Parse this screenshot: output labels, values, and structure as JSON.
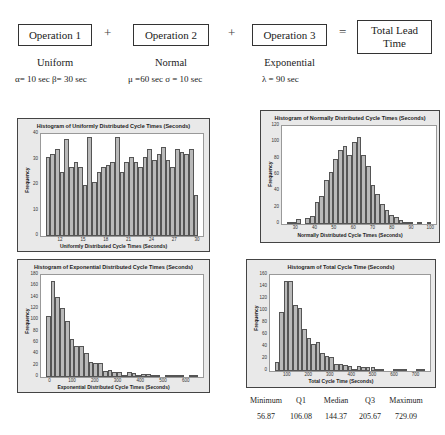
{
  "operations": [
    {
      "label": "Operation 1",
      "distribution": "Uniform",
      "params": "α= 10 sec  β= 30 sec"
    },
    {
      "label": "Operation 2",
      "distribution": "Normal",
      "params": "μ =60 sec  σ = 10 sec"
    },
    {
      "label": "Operation 3",
      "distribution": "Exponential",
      "params": "λ = 90 sec"
    }
  ],
  "operators": {
    "plus": "+",
    "equals": "="
  },
  "result": {
    "label": "Total Lead Time"
  },
  "chart_data": [
    {
      "type": "bar",
      "title": "Histogram of Uniformly Distributed Cycle Times (Seconds)",
      "xlabel": "Uniformly Distributed Cycle Times (Seconds)",
      "ylabel": "Frequency",
      "xlim": [
        10,
        30
      ],
      "ylim": [
        0,
        40
      ],
      "xticks": [
        "12",
        "15",
        "18",
        "21",
        "24",
        "27",
        "30"
      ],
      "yticks": [
        "0",
        "10",
        "20",
        "30",
        "40"
      ],
      "values": [
        31,
        32,
        34,
        25,
        38,
        27,
        29,
        27,
        20,
        39,
        21,
        25,
        27,
        28,
        29,
        39,
        25,
        29,
        31,
        29,
        27,
        31,
        34,
        30,
        32,
        35,
        30,
        27,
        34,
        33,
        32,
        34,
        16
      ]
    },
    {
      "type": "bar",
      "title": "Histogram of Normally Distributed Cycle Times (Seconds)",
      "xlabel": "Normally Distributed Cycle Times (Seconds)",
      "ylabel": "Frequency",
      "xlim": [
        25,
        100
      ],
      "ylim": [
        0,
        120
      ],
      "xticks": [
        "30",
        "40",
        "50",
        "60",
        "70",
        "80",
        "90",
        "100"
      ],
      "yticks": [
        "0",
        "20",
        "40",
        "60",
        "80",
        "100",
        "120"
      ],
      "values": [
        1,
        2,
        6,
        0,
        7,
        10,
        27,
        34,
        54,
        64,
        79,
        91,
        96,
        85,
        100,
        107,
        84,
        71,
        48,
        37,
        24,
        17,
        11,
        8,
        5,
        2,
        1,
        0,
        1,
        0,
        1
      ]
    },
    {
      "type": "bar",
      "title": "Histogram of Exponential Distributed Cycle Times (Seconds)",
      "xlabel": "Exponential Distributed Cycle Times (Seconds)",
      "ylabel": "Frequency",
      "xlim": [
        -20,
        650
      ],
      "ylim": [
        0,
        180
      ],
      "xticks": [
        "0",
        "100",
        "200",
        "300",
        "400",
        "500",
        "600"
      ],
      "yticks": [
        "0",
        "20",
        "40",
        "60",
        "80",
        "100",
        "120",
        "140",
        "160",
        "180"
      ],
      "values": [
        108,
        170,
        142,
        122,
        98,
        67,
        54,
        54,
        43,
        27,
        25,
        25,
        10,
        12,
        8,
        9,
        4,
        8,
        7,
        1,
        5,
        5,
        1,
        2,
        0,
        1,
        2,
        2,
        2,
        0,
        1,
        2
      ]
    },
    {
      "type": "bar",
      "title": "Histogram of Total Cycle Time (Seconds)",
      "xlabel": "Total Cycle Time (Seconds)",
      "ylabel": "Frequency",
      "xlim": [
        40,
        740
      ],
      "ylim": [
        0,
        160
      ],
      "xticks": [
        "100",
        "200",
        "300",
        "400",
        "500",
        "600",
        "700"
      ],
      "yticks": [
        "0",
        "20",
        "40",
        "60",
        "80",
        "100",
        "120",
        "140",
        "160"
      ],
      "values": [
        15,
        98,
        150,
        150,
        110,
        105,
        70,
        55,
        45,
        49,
        30,
        25,
        23,
        12,
        12,
        10,
        9,
        3,
        8,
        6,
        6,
        6,
        3,
        1,
        0,
        0,
        1,
        1,
        1,
        0,
        0,
        1,
        1
      ]
    }
  ],
  "summary_stats": {
    "headers": [
      "Minimum",
      "Q1",
      "Median",
      "Q3",
      "Maximum"
    ],
    "values": [
      "56.87",
      "106.08",
      "144.37",
      "205.67",
      "729.09"
    ]
  }
}
